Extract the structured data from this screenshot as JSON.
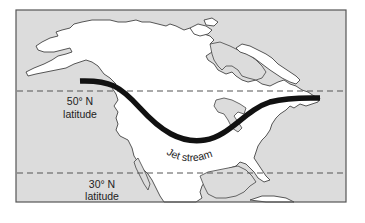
{
  "map": {
    "title": "",
    "region": "North America",
    "colors": {
      "ocean": "#dcdcdc",
      "land": "#ffffff",
      "jet_stream": "#111111",
      "outline": "#444444"
    },
    "latitude_lines": [
      {
        "degrees": "50° N",
        "label_line1": "50° N",
        "label_line2": "latitude"
      },
      {
        "degrees": "30° N",
        "label_line1": "30° N",
        "label_line2": "latitude"
      }
    ],
    "jet_stream": {
      "label": "Jet stream"
    }
  }
}
